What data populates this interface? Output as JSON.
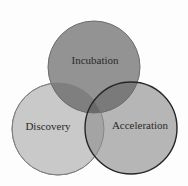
{
  "diagram": {
    "type": "venn",
    "sets": [
      {
        "label": "Incubation",
        "position": "top",
        "fill": "#8e8e8e",
        "stroke": "#6a6a6a"
      },
      {
        "label": "Discovery",
        "position": "bottom-left",
        "fill": "#c6c6c6",
        "stroke": "#7a7a7a"
      },
      {
        "label": "Acceleration",
        "position": "bottom-right",
        "fill": "#b4b4b4",
        "stroke": "#2a2a2a"
      }
    ],
    "background": "#fdfdfd"
  }
}
